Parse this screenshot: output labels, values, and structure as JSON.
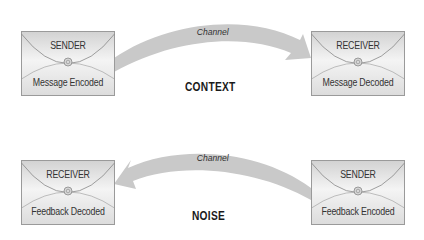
{
  "diagram": {
    "top_row": {
      "sender": {
        "role": "SENDER",
        "action": "Message Encoded"
      },
      "receiver": {
        "role": "RECEIVER",
        "action": "Message Decoded"
      },
      "channel_label": "Channel",
      "direction": "left-to-right",
      "context_label": "CONTEXT"
    },
    "bottom_row": {
      "receiver": {
        "role": "RECEIVER",
        "action": "Feedback Decoded"
      },
      "sender": {
        "role": "SENDER",
        "action": "Feedback Encoded"
      },
      "channel_label": "Channel",
      "direction": "right-to-left",
      "noise_label": "NOISE"
    },
    "colors": {
      "arrow": "#c9c9c9",
      "envelope_fill": "#e6e6e6",
      "envelope_border": "#9a9a9a",
      "text": "#333333"
    }
  }
}
